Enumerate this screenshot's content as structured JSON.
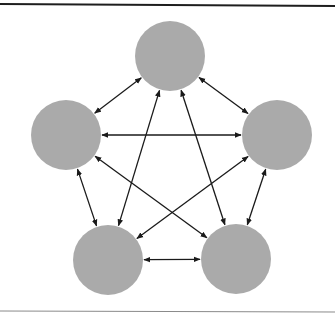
{
  "diagram": {
    "type": "complete-graph",
    "colors": {
      "background": "#ffffff",
      "node_fill": "#aaaaaa",
      "edge_stroke": "#1a1a1a",
      "top_rule": "#1e1e1e",
      "bottom_rule": "#8a8a8a"
    },
    "node_radius": 35,
    "nodes": [
      {
        "id": "top",
        "cx": 170,
        "cy": 56
      },
      {
        "id": "left",
        "cx": 66,
        "cy": 135
      },
      {
        "id": "right",
        "cx": 277,
        "cy": 135
      },
      {
        "id": "bottom-left",
        "cx": 108,
        "cy": 260
      },
      {
        "id": "bottom-right",
        "cx": 236,
        "cy": 259
      }
    ],
    "edges": [
      {
        "from": "top",
        "to": "left",
        "bidirectional": true
      },
      {
        "from": "top",
        "to": "right",
        "bidirectional": true
      },
      {
        "from": "top",
        "to": "bottom-left",
        "bidirectional": true
      },
      {
        "from": "top",
        "to": "bottom-right",
        "bidirectional": true
      },
      {
        "from": "left",
        "to": "right",
        "bidirectional": true
      },
      {
        "from": "left",
        "to": "bottom-left",
        "bidirectional": true
      },
      {
        "from": "left",
        "to": "bottom-right",
        "bidirectional": true
      },
      {
        "from": "right",
        "to": "bottom-left",
        "bidirectional": true
      },
      {
        "from": "right",
        "to": "bottom-right",
        "bidirectional": true
      },
      {
        "from": "bottom-left",
        "to": "bottom-right",
        "bidirectional": true
      }
    ]
  }
}
